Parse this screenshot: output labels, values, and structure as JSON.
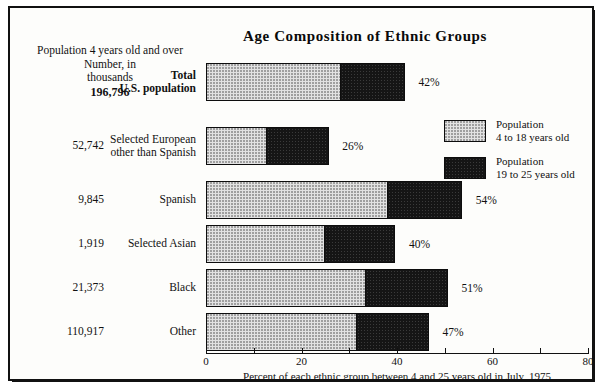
{
  "chart_data": {
    "type": "bar",
    "orientation": "horizontal",
    "stacked": true,
    "title": "Age Composition of Ethnic Groups",
    "xlabel": "Percent of each ethnic group between 4 and 25 years old in July, 1975",
    "ylabel": "",
    "xlim": [
      0,
      80
    ],
    "xticks": [
      0,
      20,
      40,
      60,
      80
    ],
    "xtick_labels": [
      "0",
      "20",
      "40",
      "60",
      "80"
    ],
    "grid": false,
    "legend_position": "right",
    "categories": [
      "Total U.S. population",
      "Selected European other than Spanish",
      "Spanish",
      "Selected Asian",
      "Black",
      "Other"
    ],
    "series": [
      {
        "name": "Population 4 to 18 years old",
        "values": [
          28.5,
          12.8,
          38.3,
          25.0,
          33.7,
          31.8
        ]
      },
      {
        "name": "Population 19 to 25 years old",
        "values": [
          13.5,
          13.2,
          15.7,
          15.0,
          17.3,
          15.2
        ]
      }
    ],
    "totals": [
      42,
      26,
      54,
      40,
      51,
      47
    ],
    "data_labels": [
      "42%",
      "26%",
      "54%",
      "40%",
      "51%",
      "47%"
    ],
    "population_numbers": [
      "196,796",
      "52,742",
      "9,845",
      "1,919",
      "21,373",
      "110,917"
    ],
    "population_units": "thousands"
  },
  "header": {
    "title": "Age Composition of Ethnic Groups",
    "left_block": {
      "line1": "Population 4 years old and over",
      "line2": "Number, in",
      "line3": "thousands",
      "total_value": "196,796"
    }
  },
  "rows": [
    {
      "number": "",
      "label_line1": "Total",
      "label_line2": "U.S. population",
      "bold": true,
      "light_value": 28.5,
      "dark_value": 13.5,
      "pct_label": "42%"
    },
    {
      "number": "52,742",
      "label_line1": "Selected European",
      "label_line2": "other than Spanish",
      "bold": false,
      "light_value": 12.8,
      "dark_value": 13.2,
      "pct_label": "26%"
    },
    {
      "number": "9,845",
      "label_line1": "Spanish",
      "label_line2": "",
      "bold": false,
      "light_value": 38.3,
      "dark_value": 15.7,
      "pct_label": "54%"
    },
    {
      "number": "1,919",
      "label_line1": "Selected Asian",
      "label_line2": "",
      "bold": false,
      "light_value": 25.0,
      "dark_value": 15.0,
      "pct_label": "40%"
    },
    {
      "number": "21,373",
      "label_line1": "Black",
      "label_line2": "",
      "bold": false,
      "light_value": 33.7,
      "dark_value": 17.3,
      "pct_label": "51%"
    },
    {
      "number": "110,917",
      "label_line1": "Other",
      "label_line2": "",
      "bold": false,
      "light_value": 31.8,
      "dark_value": 15.2,
      "pct_label": "47%"
    }
  ],
  "axis": {
    "ticks": [
      "0",
      "20",
      "40",
      "60",
      "80"
    ],
    "caption": "Percent of each ethnic group between 4 and 25 years old in July, 1975"
  },
  "legend": {
    "entries": [
      {
        "swatch": "light",
        "line1": "Population",
        "line2": "4 to 18 years old"
      },
      {
        "swatch": "dark",
        "line1": "Population",
        "line2": "19 to 25 years old"
      }
    ]
  },
  "colors": {
    "light_fill": "#e2e2e2",
    "dark_fill": "#151515",
    "outline": "#0d0d0d",
    "page": "#fdfdfb"
  }
}
